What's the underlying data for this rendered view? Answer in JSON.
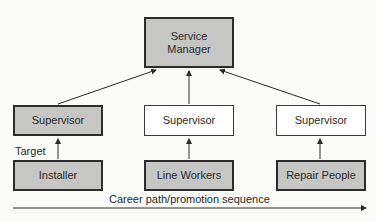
{
  "diagram": {
    "top": {
      "label_line1": "Service",
      "label_line2": "Manager",
      "shaded": true
    },
    "columns": [
      {
        "supervisor": "Supervisor",
        "supervisor_shaded": true,
        "base": "Installer",
        "base_shaded": true
      },
      {
        "supervisor": "Supervisor",
        "supervisor_shaded": false,
        "base": "Line Workers",
        "base_shaded": true
      },
      {
        "supervisor": "Supervisor",
        "supervisor_shaded": false,
        "base": "Repair People",
        "base_shaded": true
      }
    ],
    "target_label": "Target",
    "axis_caption": "Career path/promotion sequence"
  }
}
